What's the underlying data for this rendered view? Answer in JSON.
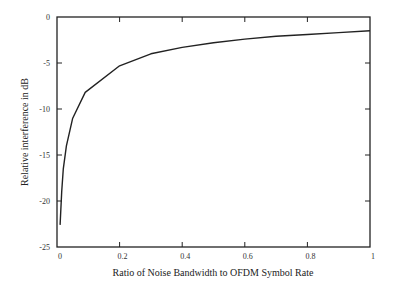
{
  "chart_data": {
    "type": "line",
    "title": "",
    "xlabel": "Ratio of Noise Bandwidth to OFDM Symbol Rate",
    "ylabel": "Relative interference in dB",
    "xlim": [
      0,
      1
    ],
    "ylim": [
      -25,
      0
    ],
    "x_ticks": [
      0,
      0.2,
      0.4,
      0.6,
      0.8,
      1
    ],
    "x_tick_labels": [
      "0",
      "0.2",
      "0.4",
      "0.6",
      "0.8",
      "1"
    ],
    "y_ticks": [
      0,
      -5,
      -10,
      -15,
      -20,
      -25
    ],
    "y_tick_labels": [
      "0",
      "-5",
      "-10",
      "-15",
      "-20",
      "-25"
    ],
    "grid": false,
    "legend": null,
    "series": [
      {
        "name": "Relative interference",
        "color": "#222222",
        "x": [
          0.01,
          0.015,
          0.02,
          0.03,
          0.05,
          0.09,
          0.2,
          0.3,
          0.4,
          0.5,
          0.6,
          0.7,
          0.8,
          0.9,
          1.0
        ],
        "y": [
          -22.6,
          -19.0,
          -16.5,
          -14.0,
          -11.0,
          -8.2,
          -5.3,
          -4.0,
          -3.3,
          -2.8,
          -2.4,
          -2.1,
          -1.9,
          -1.7,
          -1.5
        ]
      }
    ]
  }
}
